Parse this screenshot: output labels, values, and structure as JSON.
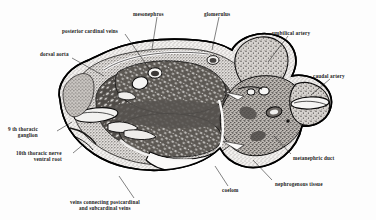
{
  "figure": {
    "kind": "histological-cross-section",
    "background_color": "#fdfdfd",
    "ink_color": "#1a1a1a",
    "outline_color": "#000000"
  },
  "labels": [
    {
      "id": "dorsal-aorta",
      "text": "dorsal aorta",
      "lines": [
        "dorsal aorta"
      ],
      "align": "left",
      "x": 40,
      "y": 51,
      "leader": {
        "x1": 72,
        "y1": 58,
        "x2": 104,
        "y2": 76
      }
    },
    {
      "id": "posterior-cardinal-veins",
      "text": "posterior cardinal veins",
      "lines": [
        "posterior cardinal veins"
      ],
      "align": "left",
      "x": 62,
      "y": 28,
      "leader": {
        "x1": 125,
        "y1": 34,
        "x2": 150,
        "y2": 70
      }
    },
    {
      "id": "mesonephros",
      "text": "mesonephros",
      "lines": [
        "mesonephros"
      ],
      "align": "left",
      "x": 133,
      "y": 11,
      "leader": {
        "x1": 157,
        "y1": 17,
        "x2": 152,
        "y2": 49
      }
    },
    {
      "id": "glomerulus",
      "text": "glomerulus",
      "lines": [
        "glomerulus"
      ],
      "align": "left",
      "x": 204,
      "y": 11,
      "leader": {
        "x1": 219,
        "y1": 17,
        "x2": 212,
        "y2": 50
      }
    },
    {
      "id": "umbilical-artery",
      "text": "umbilical artery",
      "lines": [
        "umbilical artery"
      ],
      "align": "left",
      "x": 272,
      "y": 30,
      "leader": {
        "x1": 288,
        "y1": 36,
        "x2": 268,
        "y2": 62
      }
    },
    {
      "id": "caudal-artery",
      "text": "caudal artery",
      "lines": [
        "caudal artery"
      ],
      "align": "left",
      "x": 313,
      "y": 73,
      "leader": {
        "x1": 330,
        "y1": 79,
        "x2": 311,
        "y2": 95
      }
    },
    {
      "id": "ninth-thoracic-ganglion",
      "text": "9 th thoracic ganglion",
      "lines": [
        "9 th thoracic",
        "ganglion"
      ],
      "align": "right",
      "x": 8,
      "y": 126,
      "leader": {
        "x1": 57,
        "y1": 131,
        "x2": 72,
        "y2": 122
      }
    },
    {
      "id": "tenth-thoracic-nerve-ventral-root",
      "text": "10th thoracic nerve ventral root",
      "lines": [
        "10th thoracic nerve",
        "ventral root"
      ],
      "align": "right",
      "x": 16,
      "y": 150,
      "leader": {
        "x1": 73,
        "y1": 153,
        "x2": 84,
        "y2": 144
      }
    },
    {
      "id": "veins-connecting-postcardinal-and-subcardinal-veins",
      "text": "veins connecting postcardinal and subcardinal veins",
      "lines": [
        "veins connecting postcardinal",
        "and subcardinal veins"
      ],
      "align": "center",
      "x": 70,
      "y": 199,
      "leader": {
        "x1": 134,
        "y1": 198,
        "x2": 119,
        "y2": 176
      }
    },
    {
      "id": "coelom",
      "text": "coelom",
      "lines": [
        "coelom"
      ],
      "align": "left",
      "x": 222,
      "y": 187,
      "leader": {
        "x1": 228,
        "y1": 186,
        "x2": 215,
        "y2": 166
      }
    },
    {
      "id": "nephrogenous-tissue",
      "text": "nephrogenous tissue",
      "lines": [
        "nephrogenous tissue"
      ],
      "align": "left",
      "x": 275,
      "y": 181,
      "leader": {
        "x1": 272,
        "y1": 180,
        "x2": 253,
        "y2": 160
      }
    },
    {
      "id": "metanephric-duct",
      "text": "metanephric duct",
      "lines": [
        "metanephric duct"
      ],
      "align": "left",
      "x": 293,
      "y": 155,
      "leader": {
        "x1": 291,
        "y1": 154,
        "x2": 274,
        "y2": 136
      }
    }
  ]
}
